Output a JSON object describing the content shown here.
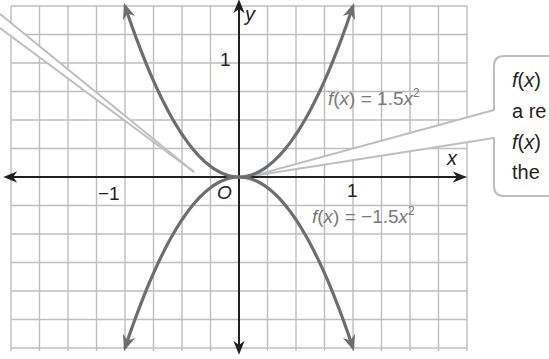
{
  "chart_data": {
    "type": "line",
    "title": "",
    "xlabel": "x",
    "ylabel": "y",
    "origin_label": "O",
    "x_tick_labels": [
      {
        "value": -1,
        "label": "−1"
      },
      {
        "value": 1,
        "label": "1"
      }
    ],
    "y_tick_labels": [
      {
        "value": 1,
        "label": "1"
      }
    ],
    "xlim": [
      -2.0,
      2.0
    ],
    "ylim": [
      -1.5,
      1.5
    ],
    "grid": true,
    "grid_step": 0.25,
    "series": [
      {
        "name": "f(x) = 1.5x^2",
        "label_parts": {
          "prefix": "f",
          "arg": "x",
          "rhs": "1.5",
          "var": "x",
          "exp": "2"
        },
        "formula": "1.5*x^2",
        "x": [
          -1.0,
          -0.75,
          -0.5,
          -0.25,
          0,
          0.25,
          0.5,
          0.75,
          1.0
        ],
        "values": [
          1.5,
          0.84,
          0.375,
          0.094,
          0,
          0.094,
          0.375,
          0.84,
          1.5
        ],
        "color": "#6d6e71"
      },
      {
        "name": "f(x) = -1.5x^2",
        "label_parts": {
          "prefix": "f",
          "arg": "x",
          "rhs": "−1.5",
          "var": "x",
          "exp": "2"
        },
        "formula": "-1.5*x^2",
        "x": [
          -1.0,
          -0.75,
          -0.5,
          -0.25,
          0,
          0.25,
          0.5,
          0.75,
          1.0
        ],
        "values": [
          -1.5,
          -0.84,
          -0.375,
          -0.094,
          0,
          -0.094,
          -0.375,
          -0.84,
          -1.5
        ],
        "color": "#6d6e71"
      }
    ],
    "annotations": [
      {
        "type": "callout-pointer",
        "from": "left-edge",
        "to_point": [
          -0.2,
          0.06
        ]
      },
      {
        "type": "callout-box",
        "lines": [
          "f(x)",
          "a re",
          "f(x)",
          "the"
        ],
        "points_to": [
          0,
          0
        ]
      }
    ]
  },
  "labels": {
    "x_axis": "x",
    "y_axis": "y",
    "origin": "O",
    "x_neg1": "−1",
    "x_pos1": "1",
    "y_pos1": "1",
    "eq_top_f": "f",
    "eq_top_x": "x",
    "eq_top_rhs": "= 1.5",
    "eq_top_var": "x",
    "eq_top_exp": "2",
    "eq_bot_f": "f",
    "eq_bot_x": "x",
    "eq_bot_rhs": "= −1.5",
    "eq_bot_var": "x",
    "eq_bot_exp": "2"
  },
  "callout": {
    "line1_f": "f",
    "line1_x": "x",
    "line2": "a re",
    "line3_f": "f",
    "line3_x": "x",
    "line4": "the"
  }
}
